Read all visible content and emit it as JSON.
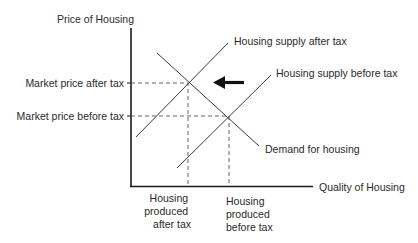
{
  "diagram": {
    "y_axis_label": "Price of Housing",
    "x_axis_label": "Quality of Housing",
    "price_labels": {
      "after_tax": "Market price after tax",
      "before_tax": "Market price before tax"
    },
    "curve_labels": {
      "supply_after_tax": "Housing supply after tax",
      "supply_before_tax": "Housing supply before tax",
      "demand": "Demand for housing"
    },
    "quantity_labels": {
      "after_tax": [
        "Housing",
        "produced",
        "after tax"
      ],
      "before_tax": [
        "Housing",
        "produced",
        "before tax"
      ]
    },
    "shift_arrow": "left",
    "colors": {
      "axis": "#1a1a1a",
      "curve": "#3a3a3a",
      "text": "#2a2a2a"
    }
  }
}
